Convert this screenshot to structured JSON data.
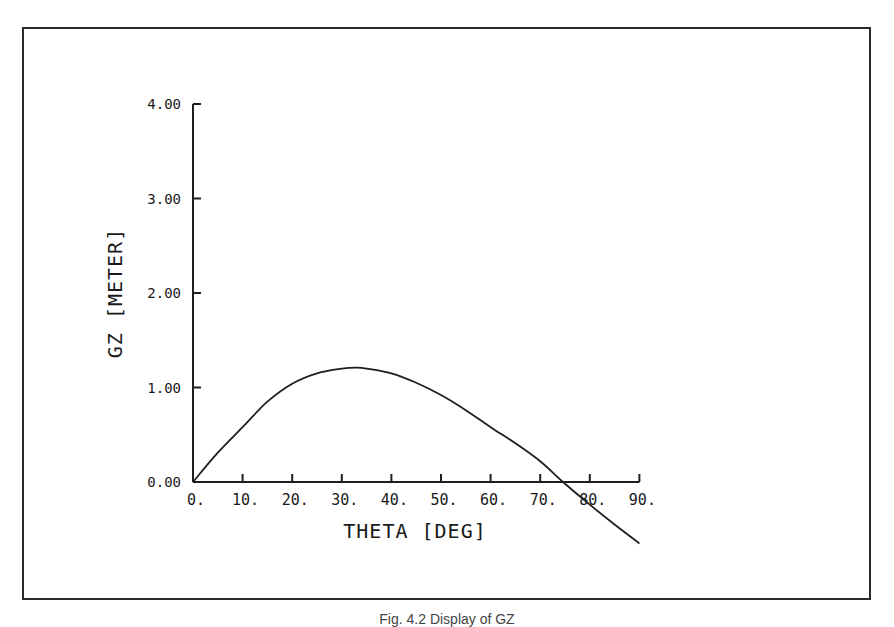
{
  "figure": {
    "caption": "Fig. 4.2 Display of GZ"
  },
  "chart_data": {
    "type": "line",
    "title": "",
    "xlabel": "THETA [DEG]",
    "ylabel": "GZ [METER]",
    "xlim": [
      0,
      90
    ],
    "ylim": [
      0,
      4
    ],
    "grid": false,
    "legend": null,
    "x_ticks": [
      "0.",
      "10.",
      "20.",
      "30.",
      "40.",
      "50.",
      "60.",
      "70.",
      "80.",
      "90."
    ],
    "y_ticks": [
      "0.00",
      "1.00",
      "2.00",
      "3.00",
      "4.00"
    ],
    "series": [
      {
        "name": "GZ",
        "x": [
          0,
          5,
          10,
          15,
          20,
          25,
          30,
          33,
          35,
          40,
          45,
          50,
          55,
          60,
          65,
          70,
          74.6,
          80,
          85,
          90
        ],
        "values": [
          0.0,
          0.31,
          0.58,
          0.85,
          1.04,
          1.15,
          1.2,
          1.21,
          1.2,
          1.15,
          1.05,
          0.92,
          0.76,
          0.58,
          0.41,
          0.22,
          0.0,
          -0.24,
          -0.45,
          -0.65
        ]
      }
    ],
    "annotations": {
      "peak": {
        "x": 33,
        "y": 1.21
      },
      "zero_crossing": {
        "x": 74.6,
        "y": 0.0
      }
    }
  }
}
